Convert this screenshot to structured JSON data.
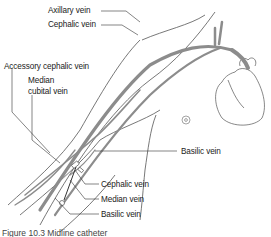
{
  "figure": {
    "labels": {
      "axillary_vein": "Axillary vein",
      "cephalic_vein_upper": "Cephalic vein",
      "accessory_cephalic_vein": "Accessory cephalic vein",
      "median_cubital_vein_1": "Median",
      "median_cubital_vein_2": "cubital vein",
      "basilic_vein_upper": "Basilic vein",
      "cephalic_vein_lower": "Cephalic vein",
      "median_vein": "Median vein",
      "basilic_vein_lower": "Basilic vein"
    },
    "caption": "Figure 10.3   Midline catheter",
    "colors": {
      "vein": "#8c8c8c",
      "outline": "#555555",
      "leader": "#333333",
      "text": "#222222"
    }
  }
}
